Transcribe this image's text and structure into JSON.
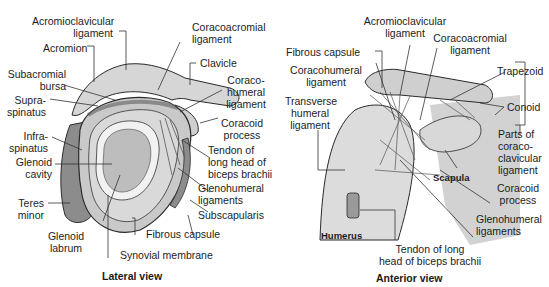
{
  "panels": [
    {
      "id": "lateral",
      "caption": "Lateral view",
      "labels": {
        "acromioclavicular_ligament": [
          "Acromioclavicular",
          "ligament"
        ],
        "acromion": "Acromion",
        "subacromial_bursa": [
          "Subacromial",
          "bursa"
        ],
        "supraspinatus": [
          "Supra-",
          "spinatus"
        ],
        "infraspinatus": [
          "Infra-",
          "spinatus"
        ],
        "glenoid_cavity": [
          "Glenoid",
          "cavity"
        ],
        "teres_minor": [
          "Teres",
          "minor"
        ],
        "glenoid_labrum": [
          "Glenoid",
          "labrum"
        ],
        "synovial_membrane": "Synovial membrane",
        "fibrous_capsule": "Fibrous capsule",
        "subscapularis": "Subscapularis",
        "glenohumeral_ligaments": [
          "Glenohumeral",
          "ligaments"
        ],
        "tendon_biceps": [
          "Tendon of",
          "long head of",
          "biceps brachii"
        ],
        "coracoid_process": [
          "Coracoid",
          "process"
        ],
        "coracohumeral_ligament": [
          "Coraco-",
          "humeral",
          "ligament"
        ],
        "clavicle": "Clavicle",
        "coracoacromial_ligament": [
          "Coracoacromial",
          "ligament"
        ]
      }
    },
    {
      "id": "anterior",
      "caption": "Anterior view",
      "labels": {
        "acromioclavicular_ligament": [
          "Acromioclavicular",
          "ligament"
        ],
        "coracoacromial_ligament": [
          "Coracoacromial",
          "ligament"
        ],
        "fibrous_capsule": "Fibrous capsule",
        "coracohumeral_ligament": [
          "Coracohumeral",
          "ligament"
        ],
        "transverse_humeral_ligament": [
          "Transverse",
          "humeral",
          "ligament"
        ],
        "trapezoid": "Trapezoid",
        "conoid": "Conoid",
        "parts_of_ccl": [
          "Parts of",
          "coraco-",
          "clavicular",
          "ligament"
        ],
        "coracoid_process": [
          "Coracoid",
          "process"
        ],
        "glenohumeral_ligaments": [
          "Glenohumeral",
          "ligaments"
        ],
        "tendon_biceps": [
          "Tendon of long",
          "head of biceps brachii"
        ],
        "scapula": "Scapula",
        "humerus": "Humerus"
      }
    }
  ],
  "colors": {
    "bone": "#dcdcdc",
    "bone_dark": "#bdbdbd",
    "muscle": "#8a8a8a",
    "outline": "#2a2a2a",
    "leader": "#333333"
  }
}
